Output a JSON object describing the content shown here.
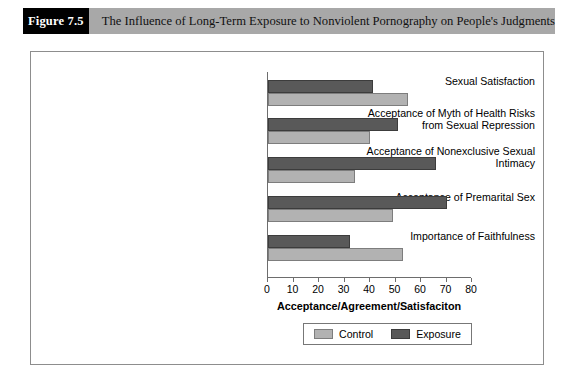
{
  "figure": {
    "number_label": "Figure 7.5",
    "caption": "The Influence of Long-Term Exposure to Nonviolent Pornography on People's Judgments"
  },
  "colors": {
    "header_band": "#a8a8a8",
    "number_box": "#000000",
    "control_bar": "#b2b2b2",
    "exposure_bar": "#595959",
    "axis": "#6d6d6d",
    "frame_border": "#8d8d8d"
  },
  "chart_data": {
    "type": "bar",
    "orientation": "horizontal",
    "title": "",
    "xlabel": "Acceptance/Agreement/Satisfaciton",
    "ylabel": "",
    "xlim": [
      0,
      80
    ],
    "xticks": [
      0,
      10,
      20,
      30,
      40,
      50,
      60,
      70,
      80
    ],
    "grid": false,
    "legend_position": "bottom-center",
    "categories": [
      "Sexual Satisfaction",
      "Acceptance of Myth of Health Risks from Sexual Repression",
      "Acceptance of Nonexclusive Sexual Intimacy",
      "Acceptance of Premarital Sex",
      "Importance of Faithfulness"
    ],
    "category_lines": [
      [
        "Sexual Satisfaction"
      ],
      [
        "Acceptance of Myth of Health Risks",
        "from Sexual Repression"
      ],
      [
        "Acceptance of Nonexclusive Sexual",
        "Intimacy"
      ],
      [
        "Acceptance of Premarital Sex"
      ],
      [
        "Importance of Faithfulness"
      ]
    ],
    "series": [
      {
        "name": "Exposure",
        "color": "#595959",
        "values": [
          41,
          51,
          66,
          70,
          32
        ]
      },
      {
        "name": "Control",
        "color": "#b2b2b2",
        "values": [
          55,
          40,
          34,
          49,
          53
        ]
      }
    ]
  },
  "legend": {
    "items": [
      {
        "label": "Control"
      },
      {
        "label": "Exposure"
      }
    ]
  }
}
